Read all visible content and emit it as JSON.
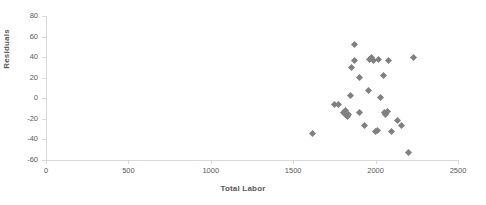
{
  "chart_data": {
    "type": "scatter",
    "title": "",
    "xlabel": "Total Labor",
    "ylabel": "Residuals",
    "xlim": [
      0,
      2500
    ],
    "ylim": [
      -60,
      80
    ],
    "xticks": [
      0,
      500,
      1000,
      1500,
      2000,
      2500
    ],
    "yticks": [
      -60,
      -40,
      -20,
      0,
      20,
      40,
      60,
      80
    ],
    "grid": false,
    "legend": null,
    "marker": "diamond",
    "marker_color": "#808080",
    "points": [
      {
        "x": 1620,
        "y": -34
      },
      {
        "x": 1750,
        "y": -6
      },
      {
        "x": 1775,
        "y": -6
      },
      {
        "x": 1805,
        "y": -14
      },
      {
        "x": 1815,
        "y": -16
      },
      {
        "x": 1820,
        "y": -12
      },
      {
        "x": 1828,
        "y": -18
      },
      {
        "x": 1838,
        "y": -16
      },
      {
        "x": 1848,
        "y": 3
      },
      {
        "x": 1855,
        "y": 30
      },
      {
        "x": 1870,
        "y": 52
      },
      {
        "x": 1872,
        "y": 37
      },
      {
        "x": 1900,
        "y": 20
      },
      {
        "x": 1905,
        "y": -14
      },
      {
        "x": 1935,
        "y": -26
      },
      {
        "x": 1955,
        "y": 8
      },
      {
        "x": 1965,
        "y": 38
      },
      {
        "x": 1975,
        "y": 40
      },
      {
        "x": 1990,
        "y": 37
      },
      {
        "x": 1998,
        "y": -32
      },
      {
        "x": 2010,
        "y": -31
      },
      {
        "x": 2020,
        "y": 38
      },
      {
        "x": 2030,
        "y": 1
      },
      {
        "x": 2045,
        "y": 22
      },
      {
        "x": 2055,
        "y": -14
      },
      {
        "x": 2062,
        "y": -16
      },
      {
        "x": 2070,
        "y": -13
      },
      {
        "x": 2080,
        "y": 37
      },
      {
        "x": 2095,
        "y": -32
      },
      {
        "x": 2130,
        "y": -22
      },
      {
        "x": 2160,
        "y": -26
      },
      {
        "x": 2197,
        "y": -53
      },
      {
        "x": 2233,
        "y": 40
      }
    ]
  }
}
